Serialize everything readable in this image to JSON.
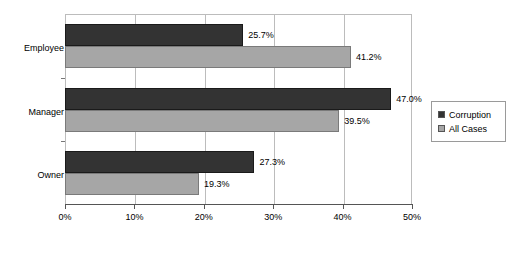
{
  "chart_data": {
    "type": "bar",
    "orientation": "horizontal",
    "title": "",
    "subtitle": "",
    "xlabel": "",
    "ylabel": "",
    "xlim": [
      0,
      50
    ],
    "xticks": [
      "0%",
      "10%",
      "20%",
      "30%",
      "40%",
      "50%"
    ],
    "xtick_values": [
      0,
      10,
      20,
      30,
      40,
      50
    ],
    "grid": true,
    "grid_axis": "x",
    "legend_position": "right",
    "categories": [
      "Employee",
      "Manager",
      "Owner"
    ],
    "series": [
      {
        "name": "Corruption",
        "color": "#333333",
        "values": [
          25.7,
          47.0,
          27.3
        ],
        "labels": [
          "25.7%",
          "47.0%",
          "27.3%"
        ]
      },
      {
        "name": "All Cases",
        "color": "#a6a6a6",
        "values": [
          41.2,
          39.5,
          19.3
        ],
        "labels": [
          "41.2%",
          "39.5%",
          "19.3%"
        ]
      }
    ]
  },
  "legend": {
    "items": [
      {
        "label": "Corruption",
        "swatch": "corruption-swatch-icon"
      },
      {
        "label": "All Cases",
        "swatch": "all-cases-swatch-icon"
      }
    ]
  },
  "colors": {
    "corruption": "#333333",
    "all_cases": "#a6a6a6",
    "grid": "#bcbcbc",
    "axis": "#555555",
    "background": "#ffffff"
  }
}
